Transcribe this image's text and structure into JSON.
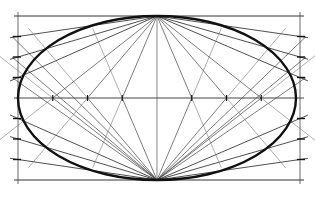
{
  "diagram": {
    "colors": {
      "ink": "#111111",
      "thin": "#333333",
      "faint": "#777777",
      "background": "#ffffff"
    },
    "rect": {
      "x1": 18,
      "y1": 16,
      "x2": 300,
      "y2": 180
    },
    "center": {
      "x": 157,
      "y": 98
    },
    "ellipse": {
      "cx": 157,
      "cy": 98,
      "rx": 139,
      "ry": 82
    },
    "divisions_per_half_side": 4,
    "side_ticks_left_y": [
      16,
      36,
      57,
      77,
      98,
      119,
      139,
      160,
      180
    ],
    "axis_ticks_x": [
      18,
      53,
      88,
      122,
      157,
      192,
      226,
      261,
      300
    ]
  }
}
